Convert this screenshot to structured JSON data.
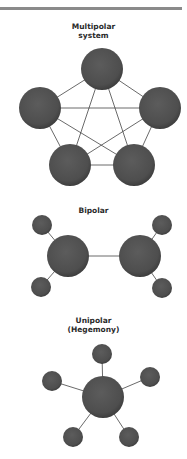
{
  "diagrams": {
    "multipolar": {
      "title_line1": "Multipolar",
      "title_line2": "system"
    },
    "bipolar": {
      "title_line1": "Bipolar"
    },
    "unipolar": {
      "title_line1": "Unipolar",
      "title_line2": "(Hegemony)"
    }
  },
  "colors": {
    "node": "#505050",
    "edge": "#444444",
    "rule": "#8a8a8a"
  }
}
